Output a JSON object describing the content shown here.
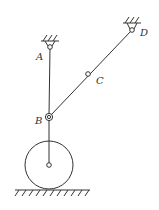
{
  "diagram": {
    "type": "mechanism",
    "colors": {
      "stroke": "#333333",
      "background": "#ffffff"
    },
    "points": {
      "A": {
        "label": "A",
        "x": 50,
        "y": 47,
        "kind": "fixed-pivot"
      },
      "D": {
        "label": "D",
        "x": 132,
        "y": 30,
        "kind": "fixed-pivot"
      },
      "C": {
        "label": "C",
        "x": 88,
        "y": 74,
        "kind": "pin"
      },
      "B": {
        "label": "B",
        "x": 49,
        "y": 117,
        "kind": "pin-collar"
      }
    },
    "links": [
      "A-B",
      "D-B",
      "B-wheel-center"
    ],
    "wheel": {
      "cx": 49,
      "cy": 165,
      "r": 24
    },
    "ground": {
      "y": 190,
      "x1": 15,
      "x2": 90
    }
  }
}
